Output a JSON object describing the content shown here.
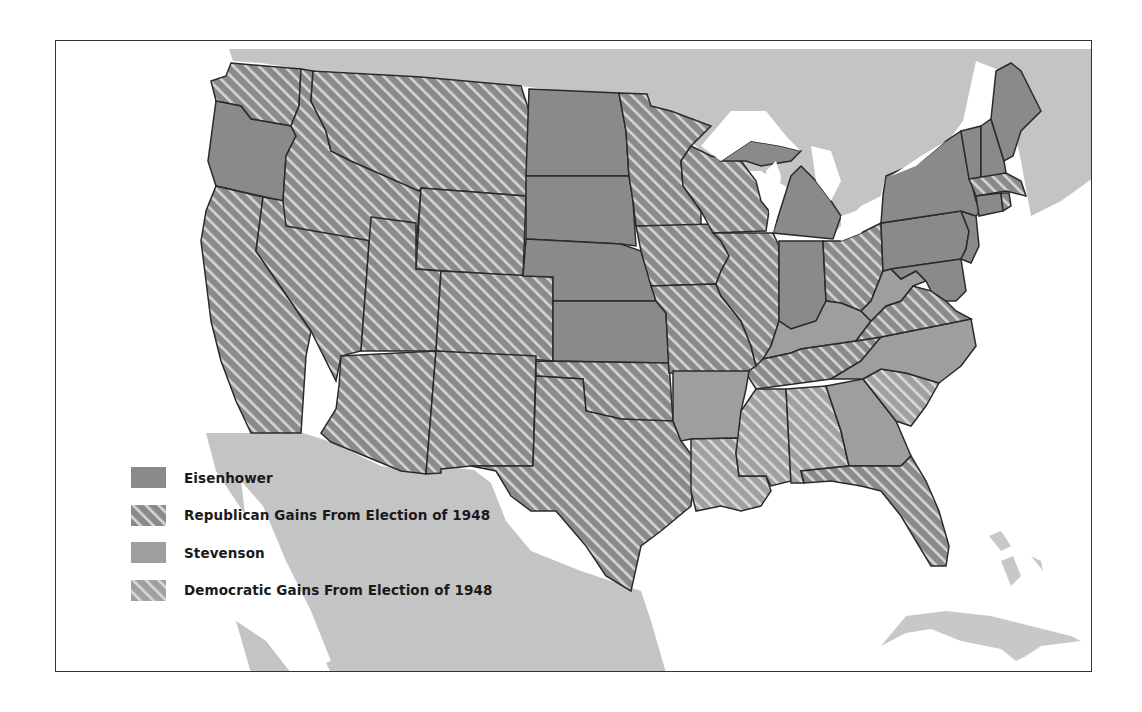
{
  "map": {
    "subject": "1952 U.S. Presidential Election Results",
    "legend": {
      "items": [
        {
          "key": "eisenhower",
          "label": "Eisenhower",
          "pattern": "solid-dark"
        },
        {
          "key": "rep_gains",
          "label": "Republican Gains From Election of 1948",
          "pattern": "hatched-dark"
        },
        {
          "key": "stevenson",
          "label": "Stevenson",
          "pattern": "solid-medium"
        },
        {
          "key": "dem_gains",
          "label": "Democratic Gains From Election of 1948",
          "pattern": "hatched-medium"
        }
      ]
    },
    "colors": {
      "eisenhower": "#8a8a8a",
      "rep_gains_base": "#8a8a8a",
      "stevenson": "#9e9e9e",
      "dem_gains_base": "#9e9e9e",
      "hatch": "#d4d4d4",
      "foreign_land": "#c4c4c4",
      "water": "#ffffff",
      "border": "#2a2a2a"
    },
    "states": {
      "eisenhower": [
        "Oregon",
        "North Dakota",
        "South Dakota",
        "Nebraska",
        "Kansas",
        "Michigan",
        "Indiana",
        "Maine",
        "Vermont",
        "New Hampshire",
        "New York",
        "Pennsylvania",
        "New Jersey",
        "Connecticut",
        "Delaware",
        "Maryland"
      ],
      "republican_gains": [
        "Washington",
        "California",
        "Nevada",
        "Idaho",
        "Montana",
        "Wyoming",
        "Utah",
        "Colorado",
        "Arizona",
        "New Mexico",
        "Oklahoma",
        "Texas",
        "Minnesota",
        "Iowa",
        "Missouri",
        "Wisconsin",
        "Illinois",
        "Ohio",
        "Massachusetts",
        "Rhode Island",
        "Virginia",
        "Tennessee",
        "Florida"
      ],
      "stevenson": [
        "Arkansas",
        "Georgia",
        "Kentucky",
        "West Virginia",
        "North Carolina"
      ],
      "democratic_gains": [
        "Louisiana",
        "Mississippi",
        "Alabama",
        "South Carolina"
      ]
    }
  }
}
